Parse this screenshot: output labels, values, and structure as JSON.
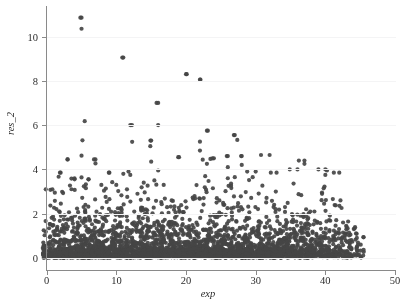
{
  "chart_data": {
    "type": "scatter",
    "title": "",
    "subtitle": "",
    "xlabel": "exp",
    "ylabel": "res_2",
    "xlim": [
      -1.5,
      51.5
    ],
    "ylim": [
      -0.25,
      11.3
    ],
    "xticks": [
      0,
      10,
      20,
      30,
      40,
      50
    ],
    "yticks": [
      0,
      2,
      4,
      6,
      8,
      10
    ],
    "xtick_labels": [
      "0",
      "10",
      "20",
      "30",
      "40",
      "50"
    ],
    "ytick_labels": [
      "0",
      "2",
      "4",
      "6",
      "8",
      "10"
    ],
    "grid": "horizontal-faint",
    "legend": "none",
    "marker": {
      "shape": "circle",
      "color": "#454545",
      "size_px": 4.2,
      "opacity": 0.92
    },
    "background_color": "#ffffff",
    "axis_color": "#8a8a8a",
    "gridline_color": "#f4f4f5",
    "x_column_range": [
      0,
      45
    ],
    "notable_points": [
      {
        "x": 5,
        "y": 10.85
      },
      {
        "x": 5,
        "y": 10.35
      },
      {
        "x": 11,
        "y": 9.05
      },
      {
        "x": 20,
        "y": 8.3
      },
      {
        "x": 22,
        "y": 8.05
      },
      {
        "x": 16,
        "y": 7.0
      },
      {
        "x": 12,
        "y": 6.0
      },
      {
        "x": 16,
        "y": 6.0
      },
      {
        "x": 23,
        "y": 5.75
      },
      {
        "x": 27,
        "y": 5.55
      },
      {
        "x": 15,
        "y": 5.3
      },
      {
        "x": 22,
        "y": 5.25
      },
      {
        "x": 22,
        "y": 4.85
      },
      {
        "x": 5,
        "y": 4.62
      },
      {
        "x": 32,
        "y": 4.65
      },
      {
        "x": 26,
        "y": 4.6
      },
      {
        "x": 28,
        "y": 4.6
      },
      {
        "x": 19,
        "y": 4.55
      },
      {
        "x": 24,
        "y": 4.5
      },
      {
        "x": 3,
        "y": 4.45
      },
      {
        "x": 7,
        "y": 4.45
      },
      {
        "x": 37,
        "y": 4.4
      },
      {
        "x": 37,
        "y": 4.25
      },
      {
        "x": 15,
        "y": 4.35
      },
      {
        "x": 23,
        "y": 4.25
      },
      {
        "x": 28,
        "y": 4.2
      },
      {
        "x": 26,
        "y": 4.1
      },
      {
        "x": 16,
        "y": 3.95
      },
      {
        "x": 30,
        "y": 3.9
      },
      {
        "x": 2,
        "y": 3.85
      },
      {
        "x": 9,
        "y": 3.85
      },
      {
        "x": 33,
        "y": 3.85
      },
      {
        "x": 42,
        "y": 3.85
      },
      {
        "x": 40,
        "y": 4.0
      },
      {
        "x": 36,
        "y": 4.0
      },
      {
        "x": 12,
        "y": 3.75
      },
      {
        "x": 11,
        "y": 3.8
      },
      {
        "x": 40,
        "y": 3.75
      },
      {
        "x": 26,
        "y": 3.6
      },
      {
        "x": 27,
        "y": 3.65
      },
      {
        "x": 4,
        "y": 3.55
      },
      {
        "x": 6,
        "y": 3.55
      }
    ],
    "series": [
      {
        "name": "res_2",
        "n_points_approx": 2300,
        "density_by_band": [
          {
            "y_range": [
              0.0,
              0.5
            ],
            "share": 0.3
          },
          {
            "y_range": [
              0.5,
              1.0
            ],
            "share": 0.26
          },
          {
            "y_range": [
              1.0,
              1.5
            ],
            "share": 0.19
          },
          {
            "y_range": [
              1.5,
              2.0
            ],
            "share": 0.12
          },
          {
            "y_range": [
              2.0,
              2.5
            ],
            "share": 0.065
          },
          {
            "y_range": [
              2.5,
              3.0
            ],
            "share": 0.035
          },
          {
            "y_range": [
              3.0,
              4.0
            ],
            "share": 0.02
          },
          {
            "y_range": [
              4.0,
              11.0
            ],
            "share": 0.01
          }
        ],
        "column_weights": [
          0.62,
          0.7,
          0.8,
          0.88,
          0.94,
          1.0,
          0.98,
          0.96,
          0.95,
          0.93,
          0.92,
          0.9,
          0.9,
          0.89,
          0.9,
          0.91,
          0.9,
          0.88,
          0.88,
          0.89,
          0.9,
          0.88,
          0.87,
          0.86,
          0.85,
          0.84,
          0.84,
          0.83,
          0.82,
          0.8,
          0.79,
          0.78,
          0.77,
          0.75,
          0.73,
          0.72,
          0.7,
          0.67,
          0.64,
          0.6,
          0.56,
          0.52,
          0.46,
          0.4,
          0.33,
          0.22
        ],
        "column_max": [
          3.1,
          3.1,
          3.85,
          4.45,
          3.6,
          10.85,
          3.55,
          4.45,
          3.3,
          3.85,
          3.3,
          9.05,
          6.0,
          2.9,
          3.4,
          5.3,
          7.0,
          3.3,
          2.6,
          4.55,
          8.3,
          2.8,
          8.05,
          5.75,
          4.5,
          2.6,
          4.6,
          5.55,
          4.6,
          3.9,
          2.3,
          4.65,
          3.85,
          3.0,
          2.3,
          4.0,
          4.4,
          2.2,
          2.1,
          4.0,
          3.95,
          3.85,
          2.6,
          1.8,
          1.5,
          1.3
        ]
      }
    ]
  }
}
